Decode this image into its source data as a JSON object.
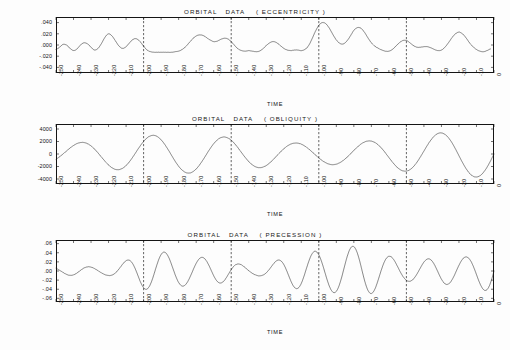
{
  "figure": {
    "axis_name": "TIME",
    "panels": [
      {
        "id": "eccentricity",
        "title": "ORBITAL   DATA    ( ECCENTRICITY )",
        "ylabels": [
          ".040",
          ".020",
          ".000",
          "-.020",
          "-.040"
        ]
      },
      {
        "id": "obliquity",
        "title": "ORBITAL   DATA    ( OBLIQUITY )",
        "ylabels": [
          "4000",
          "2000",
          "0",
          "-2000",
          "-4000"
        ]
      },
      {
        "id": "precession",
        "title": "ORBITAL   DATA    ( PRECESSION )",
        "ylabels": [
          ".06",
          ".04",
          ".02",
          ".00",
          "-.02",
          "-.04",
          "-.06"
        ]
      }
    ],
    "xlabels": [
      "-250",
      "-240",
      "-230",
      "-220",
      "-210",
      "-200",
      "-190",
      "-180",
      "-170",
      "-160",
      "-150",
      "-140",
      "-130",
      "-120",
      "-110",
      "-100",
      "-90",
      "-80",
      "-70",
      "-60",
      "-50",
      "-40",
      "-30",
      "-20",
      "-10",
      "0"
    ]
  },
  "chart_data": [
    {
      "type": "line",
      "id": "eccentricity",
      "title": "ORBITAL   DATA    ( ECCENTRICITY )",
      "xlabel": "TIME",
      "ylabel": "",
      "xlim": [
        -250,
        0
      ],
      "ylim": [
        -0.05,
        0.05
      ],
      "yticks": [
        0.04,
        0.02,
        0.0,
        -0.02,
        -0.04
      ],
      "ytick_labels": [
        ".040",
        ".020",
        ".000",
        "-.020",
        "-.040"
      ],
      "xticks": [
        -250,
        -240,
        -230,
        -220,
        -210,
        -200,
        -190,
        -180,
        -170,
        -160,
        -150,
        -140,
        -130,
        -120,
        -110,
        -100,
        -90,
        -80,
        -70,
        -60,
        -50,
        -40,
        -30,
        -20,
        -10,
        0
      ],
      "grid": false,
      "legend": "none",
      "vertical_markers": [
        -200,
        -150,
        -100,
        -50
      ],
      "series": [
        {
          "name": "eccentricity",
          "x": [
            -250,
            -248,
            -246,
            -244,
            -242,
            -240,
            -238,
            -236,
            -234,
            -232,
            -230,
            -228,
            -226,
            -224,
            -222,
            -220,
            -218,
            -216,
            -214,
            -212,
            -210,
            -208,
            -206,
            -204,
            -202,
            -200,
            -198,
            -196,
            -194,
            -192,
            -190,
            -188,
            -186,
            -184,
            -182,
            -180,
            -178,
            -176,
            -174,
            -172,
            -170,
            -168,
            -166,
            -164,
            -162,
            -160,
            -158,
            -156,
            -154,
            -152,
            -150,
            -148,
            -146,
            -144,
            -142,
            -140,
            -138,
            -136,
            -134,
            -132,
            -130,
            -128,
            -126,
            -124,
            -122,
            -120,
            -118,
            -116,
            -114,
            -112,
            -110,
            -108,
            -106,
            -104,
            -102,
            -100,
            -98,
            -96,
            -94,
            -92,
            -90,
            -88,
            -86,
            -84,
            -82,
            -80,
            -78,
            -76,
            -74,
            -72,
            -70,
            -68,
            -66,
            -64,
            -62,
            -60,
            -58,
            -56,
            -54,
            -52,
            -50,
            -48,
            -46,
            -44,
            -42,
            -40,
            -38,
            -36,
            -34,
            -32,
            -30,
            -28,
            -26,
            -24,
            -22,
            -20,
            -18,
            -16,
            -14,
            -12,
            -10,
            -8,
            -6,
            -4,
            -2,
            0
          ],
          "y": [
            -0.008,
            -0.004,
            0.001,
            0.0,
            -0.006,
            -0.01,
            -0.007,
            0.0,
            0.004,
            0.002,
            -0.004,
            -0.009,
            -0.006,
            0.003,
            0.014,
            0.02,
            0.016,
            0.007,
            -0.002,
            -0.006,
            -0.003,
            0.004,
            0.01,
            0.011,
            0.006,
            -0.002,
            -0.009,
            -0.012,
            -0.013,
            -0.013,
            -0.013,
            -0.013,
            -0.013,
            -0.013,
            -0.012,
            -0.011,
            -0.008,
            -0.003,
            0.004,
            0.011,
            0.016,
            0.018,
            0.017,
            0.013,
            0.009,
            0.006,
            0.007,
            0.01,
            0.012,
            0.011,
            0.006,
            -0.001,
            -0.007,
            -0.01,
            -0.011,
            -0.01,
            -0.011,
            -0.012,
            -0.011,
            -0.007,
            -0.001,
            0.004,
            0.006,
            0.004,
            -0.001,
            -0.006,
            -0.009,
            -0.01,
            -0.009,
            -0.009,
            -0.01,
            -0.008,
            -0.002,
            0.01,
            0.024,
            0.035,
            0.04,
            0.038,
            0.03,
            0.019,
            0.009,
            0.003,
            0.002,
            0.007,
            0.016,
            0.026,
            0.031,
            0.03,
            0.023,
            0.013,
            0.004,
            -0.002,
            -0.006,
            -0.009,
            -0.011,
            -0.011,
            -0.008,
            -0.002,
            0.004,
            0.008,
            0.008,
            0.004,
            -0.001,
            -0.004,
            -0.004,
            -0.003,
            -0.003,
            -0.005,
            -0.008,
            -0.01,
            -0.009,
            -0.004,
            0.004,
            0.013,
            0.02,
            0.023,
            0.02,
            0.013,
            0.004,
            -0.003,
            -0.008,
            -0.011,
            -0.012,
            -0.01,
            -0.007
          ]
        }
      ]
    },
    {
      "type": "line",
      "id": "obliquity",
      "title": "ORBITAL   DATA    ( OBLIQUITY )",
      "xlabel": "TIME",
      "ylabel": "",
      "xlim": [
        -250,
        0
      ],
      "ylim": [
        -4800,
        4800
      ],
      "yticks": [
        4000,
        2000,
        0,
        -2000,
        -4000
      ],
      "ytick_labels": [
        "4000",
        "2000",
        "0",
        "-2000",
        "-4000"
      ],
      "xticks": [
        -250,
        -240,
        -230,
        -220,
        -210,
        -200,
        -190,
        -180,
        -170,
        -160,
        -150,
        -140,
        -130,
        -120,
        -110,
        -100,
        -90,
        -80,
        -70,
        -60,
        -50,
        -40,
        -30,
        -20,
        -10,
        0
      ],
      "grid": false,
      "legend": "none",
      "vertical_markers": [
        -200,
        -150,
        -100,
        -50
      ],
      "description": "Quasi-periodic oscillation, dominant period about 41 kyr, amplitude modulated between roughly 1500 and 4200 units.",
      "synthesis": {
        "carrier_period_kyr": 41,
        "carrier_amplitude": 2600,
        "modulation": [
          {
            "period_kyr": 1200,
            "amplitude": 700,
            "phase": 0.4
          },
          {
            "period_kyr": 175,
            "amplitude": 850,
            "phase": 1.9
          }
        ]
      }
    },
    {
      "type": "line",
      "id": "precession",
      "title": "ORBITAL   DATA    ( PRECESSION )",
      "xlabel": "TIME",
      "ylabel": "",
      "xlim": [
        -250,
        0
      ],
      "ylim": [
        -0.068,
        0.068
      ],
      "yticks": [
        0.06,
        0.04,
        0.02,
        0.0,
        -0.02,
        -0.04,
        -0.06
      ],
      "ytick_labels": [
        ".06",
        ".04",
        ".02",
        ".00",
        "-.02",
        "-.04",
        "-.06"
      ],
      "xticks": [
        -250,
        -240,
        -230,
        -220,
        -210,
        -200,
        -190,
        -180,
        -170,
        -160,
        -150,
        -140,
        -130,
        -120,
        -110,
        -100,
        -90,
        -80,
        -70,
        -60,
        -50,
        -40,
        -30,
        -20,
        -10,
        0
      ],
      "grid": false,
      "legend": "none",
      "vertical_markers": [
        -200,
        -150,
        -100,
        -50
      ],
      "description": "Precession index: about 21 kyr carrier with strong eccentricity driven amplitude modulation; envelope peaks near -235, -195, -155, -105, -60 and -20 kyr.",
      "synthesis": {
        "carrier_period_kyr": 21.5,
        "carrier_amplitude": 0.03,
        "modulation": [
          {
            "period_kyr": 100,
            "amplitude": 0.016,
            "phase": 0.8
          },
          {
            "period_kyr": 405,
            "amplitude": 0.009,
            "phase": 2.2
          },
          {
            "period_kyr": 41,
            "amplitude": 0.005,
            "phase": 0.3
          }
        ]
      }
    }
  ]
}
